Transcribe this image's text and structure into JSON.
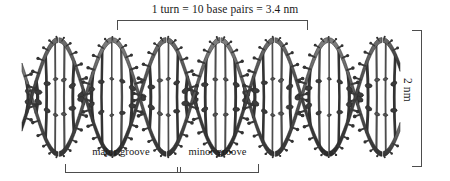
{
  "figure": {
    "background_color": "#ffffff",
    "molecule_color": "#3a3a3a",
    "annotation_color": "#1a1a1a"
  },
  "annotations": {
    "top_bracket_label": "1 turn = 10 base pairs = 3.4 nm",
    "right_bracket_label": "2 nm",
    "major_groove_label": "major groove",
    "minor_groove_label": "minor groove"
  },
  "measurements": {
    "turn_base_pairs": 10,
    "turn_length_nm": 3.4,
    "diameter_nm": 2
  },
  "brackets": {
    "top": {
      "x1": 117,
      "x2": 307,
      "y": 20,
      "tick": 10,
      "direction": "down"
    },
    "bottom": {
      "x1": 65,
      "x2": 258,
      "divider_x": 177,
      "y": 172,
      "tick": 8,
      "direction": "up"
    },
    "right": {
      "x": 421,
      "y1": 30,
      "y2": 166,
      "tick": 9,
      "direction": "left"
    }
  },
  "helix": {
    "strand_count": 2,
    "turns_visible": 3.5,
    "base_pair_rungs": 40,
    "axis_y": 97,
    "amplitude": 57,
    "x_start": 22,
    "x_end": 400,
    "period": 108
  }
}
